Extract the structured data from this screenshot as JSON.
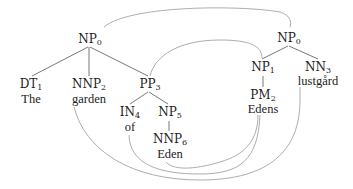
{
  "diagram": {
    "type": "tree-alignment",
    "source_tree": {
      "root": {
        "tag": "NP",
        "index": "0"
      },
      "nodes": [
        {
          "id": "s_np0",
          "tag": "NP",
          "index": "0"
        },
        {
          "id": "s_dt1",
          "tag": "DT",
          "index": "1",
          "word": "The"
        },
        {
          "id": "s_nnp2",
          "tag": "NNP",
          "index": "2",
          "word": "garden"
        },
        {
          "id": "s_pp3",
          "tag": "PP",
          "index": "3"
        },
        {
          "id": "s_in4",
          "tag": "IN",
          "index": "4",
          "word": "of"
        },
        {
          "id": "s_np5",
          "tag": "NP",
          "index": "5"
        },
        {
          "id": "s_nnp6",
          "tag": "NNP",
          "index": "6",
          "word": "Eden"
        }
      ]
    },
    "target_tree": {
      "nodes": [
        {
          "id": "t_np0",
          "tag": "NP",
          "index": "0"
        },
        {
          "id": "t_np1",
          "tag": "NP",
          "index": "1"
        },
        {
          "id": "t_pm2",
          "tag": "PM",
          "index": "2",
          "word": "Edens"
        },
        {
          "id": "t_nn3",
          "tag": "NN",
          "index": "3",
          "word": "lustgård"
        }
      ]
    },
    "alignments": [
      {
        "from": "NP_0 (source)",
        "to": "NP_0 (target)"
      },
      {
        "from": "PP_3",
        "to": "NP_1"
      },
      {
        "from": "garden",
        "to": "lustgård"
      },
      {
        "from": "of",
        "to": "Edens"
      },
      {
        "from": "Eden",
        "to": "Edens"
      }
    ]
  },
  "labels": {
    "s_np0": {
      "tag": "NP",
      "idx": "0"
    },
    "s_dt1": {
      "tag": "DT",
      "idx": "1"
    },
    "s_nnp2": {
      "tag": "NNP",
      "idx": "2"
    },
    "s_pp3": {
      "tag": "PP",
      "idx": "3"
    },
    "s_in4": {
      "tag": "IN",
      "idx": "4"
    },
    "s_np5": {
      "tag": "NP",
      "idx": "5"
    },
    "s_nnp6": {
      "tag": "NNP",
      "idx": "6"
    },
    "t_np0": {
      "tag": "NP",
      "idx": "0"
    },
    "t_np1": {
      "tag": "NP",
      "idx": "1"
    },
    "t_pm2": {
      "tag": "PM",
      "idx": "2"
    },
    "t_nn3": {
      "tag": "NN",
      "idx": "3"
    }
  },
  "words": {
    "the": "The",
    "garden": "garden",
    "of": "of",
    "eden": "Eden",
    "edens": "Edens",
    "lustgard": "lustgård"
  }
}
